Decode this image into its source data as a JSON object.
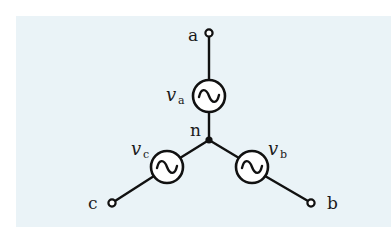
{
  "diagram": {
    "type": "three-phase wye-connected voltage sources",
    "colors": {
      "background": "#eaf3f7",
      "wire": "#111111",
      "source_fill": "#ffffff"
    },
    "node": {
      "label": "n"
    },
    "terminals": {
      "a": {
        "label": "a"
      },
      "b": {
        "label": "b"
      },
      "c": {
        "label": "c"
      }
    },
    "sources": {
      "a": {
        "symbol": "v",
        "subscript": "a"
      },
      "b": {
        "symbol": "v",
        "subscript": "b"
      },
      "c": {
        "symbol": "v",
        "subscript": "c"
      }
    }
  }
}
